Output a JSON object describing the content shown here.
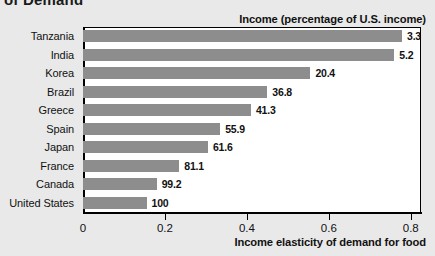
{
  "figure": {
    "heading": "of Demand",
    "header_label": "Income (percentage of U.S. income)",
    "x_title": "Income elasticity of demand for food",
    "bar_color": "#8d8d8d",
    "background": "#e9e9e9",
    "plot_background": "#ffffff"
  },
  "chart_data": {
    "type": "bar",
    "orientation": "horizontal",
    "title": "of Demand",
    "xlabel": "Income elasticity of demand for food",
    "ylabel": "",
    "series_label": "Income (percentage of U.S. income)",
    "categories": [
      "Tanzania",
      "India",
      "Korea",
      "Brazil",
      "Greece",
      "Spain",
      "Japan",
      "France",
      "Canada",
      "United States"
    ],
    "values": [
      0.785,
      0.76,
      0.555,
      0.45,
      0.41,
      0.335,
      0.305,
      0.235,
      0.18,
      0.155
    ],
    "data_labels": [
      "3.3",
      "5.2",
      "20.4",
      "36.8",
      "41.3",
      "55.9",
      "61.6",
      "81.1",
      "99.2",
      "100"
    ],
    "income_percent_of_us": [
      3.3,
      5.2,
      20.4,
      36.8,
      41.3,
      55.9,
      61.6,
      81.1,
      99.2,
      100
    ],
    "xlim": [
      0,
      0.825
    ],
    "xticks": [
      0,
      0.2,
      0.4,
      0.6,
      0.8
    ],
    "xticklabels": [
      "0",
      "0.2",
      "0.4",
      "0.6",
      "0.8"
    ],
    "grid": false,
    "legend": "none"
  }
}
